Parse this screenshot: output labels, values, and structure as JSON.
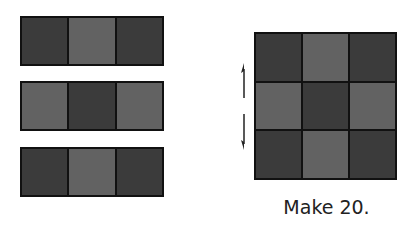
{
  "strips": [
    {
      "cells": [
        "dark",
        "light",
        "dark"
      ]
    },
    {
      "cells": [
        "light",
        "dark",
        "light"
      ]
    },
    {
      "cells": [
        "dark",
        "light",
        "dark"
      ]
    }
  ],
  "grid": {
    "rows": [
      [
        "dark",
        "light",
        "dark"
      ],
      [
        "light",
        "dark",
        "light"
      ],
      [
        "dark",
        "light",
        "dark"
      ]
    ]
  },
  "arrows": [
    "arrow-up-icon",
    "arrow-down-icon"
  ],
  "caption": "Make 20.",
  "colors": {
    "dark": "#3b3b3b",
    "light": "#626262",
    "border": "#111111"
  }
}
